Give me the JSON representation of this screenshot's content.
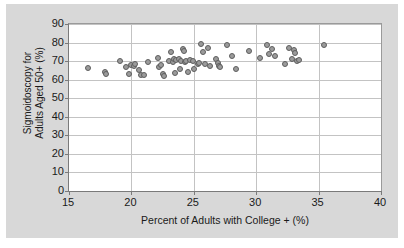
{
  "chart_data": {
    "type": "scatter",
    "title": "",
    "subtitle": "",
    "xlabel": "Percent of Adults with College + (%)",
    "ylabel": "Sigmoidoscopy for Adults Aged 50+ (%)",
    "ylabel_line1": "Sigmoidoscopy for",
    "ylabel_line2": "Adults Aged 50+ (%)",
    "xlim": [
      15,
      40
    ],
    "ylim": [
      0,
      90
    ],
    "xticks": [
      15,
      20,
      25,
      30,
      35,
      40
    ],
    "yticks": [
      0,
      10,
      20,
      30,
      40,
      50,
      60,
      70,
      80,
      90
    ],
    "xtick_labels": [
      "15",
      "20",
      "25",
      "30",
      "35",
      "40"
    ],
    "ytick_labels": [
      "0",
      "10",
      "20",
      "30",
      "40",
      "50",
      "60",
      "70",
      "80",
      "90"
    ],
    "grid": {
      "horizontal": true,
      "vertical": true
    },
    "legend": {
      "visible": false,
      "position": "none"
    },
    "marker": {
      "shape": "circle",
      "fill_color": "#9b9b9b",
      "edge_color": "#5e5e5e",
      "size_px": 6
    },
    "n_points": 63,
    "series": [
      {
        "name": "States",
        "points": [
          [
            16.5,
            66.1
          ],
          [
            17.9,
            64.3
          ],
          [
            18.0,
            63.3
          ],
          [
            19.1,
            69.8
          ],
          [
            19.6,
            66.7
          ],
          [
            19.8,
            63.1
          ],
          [
            20.0,
            68.1
          ],
          [
            20.2,
            67.4
          ],
          [
            20.3,
            68.2
          ],
          [
            20.6,
            65.0
          ],
          [
            20.8,
            62.7
          ],
          [
            21.0,
            62.6
          ],
          [
            21.3,
            69.3
          ],
          [
            22.1,
            71.5
          ],
          [
            22.2,
            66.9
          ],
          [
            22.4,
            67.9
          ],
          [
            22.5,
            63.0
          ],
          [
            22.6,
            62.0
          ],
          [
            23.0,
            70.3
          ],
          [
            23.2,
            75.1
          ],
          [
            23.3,
            69.3
          ],
          [
            23.4,
            71.0
          ],
          [
            23.5,
            63.8
          ],
          [
            23.6,
            70.8
          ],
          [
            23.8,
            71.2
          ],
          [
            23.9,
            65.8
          ],
          [
            24.0,
            70.0
          ],
          [
            24.1,
            76.6
          ],
          [
            24.2,
            75.4
          ],
          [
            24.3,
            69.4
          ],
          [
            24.4,
            70.1
          ],
          [
            24.5,
            64.4
          ],
          [
            24.7,
            70.6
          ],
          [
            24.9,
            70.3
          ],
          [
            25.0,
            65.6
          ],
          [
            25.3,
            68.6
          ],
          [
            25.4,
            69.2
          ],
          [
            25.6,
            79.0
          ],
          [
            25.7,
            74.7
          ],
          [
            25.9,
            68.2
          ],
          [
            26.1,
            77.2
          ],
          [
            26.3,
            67.6
          ],
          [
            26.8,
            70.9
          ],
          [
            26.9,
            68.9
          ],
          [
            27.0,
            67.2
          ],
          [
            27.1,
            66.8
          ],
          [
            27.7,
            78.7
          ],
          [
            28.1,
            72.5
          ],
          [
            28.4,
            66.0
          ],
          [
            29.4,
            75.3
          ],
          [
            30.3,
            71.6
          ],
          [
            30.9,
            78.7
          ],
          [
            31.0,
            74.0
          ],
          [
            31.3,
            76.3
          ],
          [
            31.5,
            73.0
          ],
          [
            32.3,
            68.7
          ],
          [
            32.6,
            77.3
          ],
          [
            32.9,
            71.2
          ],
          [
            33.0,
            76.1
          ],
          [
            33.1,
            74.2
          ],
          [
            33.3,
            70.2
          ],
          [
            33.4,
            70.5
          ],
          [
            35.4,
            78.8
          ]
        ]
      }
    ]
  }
}
